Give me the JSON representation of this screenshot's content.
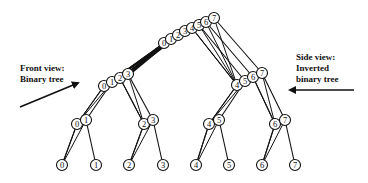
{
  "labels": {
    "front": {
      "line1": "Front view:",
      "line2": "Binary tree"
    },
    "side": {
      "line1": "Side view:",
      "line2": "Inverted",
      "line3": "binary tree"
    }
  },
  "colors": {
    "stroke": "#111111",
    "fill": "#ffffff",
    "background": "#ffffff"
  },
  "node_radius": 5.5,
  "levels": {
    "root": [
      {
        "id": "0",
        "x": 164,
        "y": 43
      },
      {
        "id": "1",
        "x": 171,
        "y": 39
      },
      {
        "id": "2",
        "x": 178,
        "y": 35
      },
      {
        "id": "3",
        "x": 185,
        "y": 31
      },
      {
        "id": "4",
        "x": 192,
        "y": 28
      },
      {
        "id": "5",
        "x": 199,
        "y": 25
      },
      {
        "id": "6",
        "x": 206,
        "y": 22
      },
      {
        "id": "7",
        "x": 214,
        "y": 18
      }
    ],
    "level1": [
      {
        "id": "0",
        "x": 104,
        "y": 86
      },
      {
        "id": "1",
        "x": 112,
        "y": 82
      },
      {
        "id": "2",
        "x": 120,
        "y": 78
      },
      {
        "id": "3",
        "x": 128,
        "y": 74
      },
      {
        "id": "4",
        "x": 237,
        "y": 85
      },
      {
        "id": "5",
        "x": 245,
        "y": 81
      },
      {
        "id": "6",
        "x": 253,
        "y": 77
      },
      {
        "id": "7",
        "x": 262,
        "y": 73
      }
    ],
    "level2": [
      {
        "id": "0",
        "x": 77,
        "y": 124
      },
      {
        "id": "1",
        "x": 86,
        "y": 120
      },
      {
        "id": "2",
        "x": 144,
        "y": 124
      },
      {
        "id": "3",
        "x": 153,
        "y": 120
      },
      {
        "id": "4",
        "x": 209,
        "y": 124
      },
      {
        "id": "5",
        "x": 219,
        "y": 120
      },
      {
        "id": "6",
        "x": 275,
        "y": 124
      },
      {
        "id": "7",
        "x": 285,
        "y": 120
      }
    ],
    "leaves": [
      {
        "id": "0",
        "x": 62,
        "y": 165
      },
      {
        "id": "1",
        "x": 96,
        "y": 165
      },
      {
        "id": "2",
        "x": 129,
        "y": 165
      },
      {
        "id": "3",
        "x": 163,
        "y": 165
      },
      {
        "id": "4",
        "x": 196,
        "y": 165
      },
      {
        "id": "5",
        "x": 229,
        "y": 165
      },
      {
        "id": "6",
        "x": 262,
        "y": 165
      },
      {
        "id": "7",
        "x": 295,
        "y": 165
      }
    ]
  },
  "arrows": {
    "front": {
      "x1": 20,
      "y1": 107,
      "x2": 78,
      "y2": 83
    },
    "side": {
      "x1": 354,
      "y1": 90,
      "x2": 290,
      "y2": 90
    }
  }
}
